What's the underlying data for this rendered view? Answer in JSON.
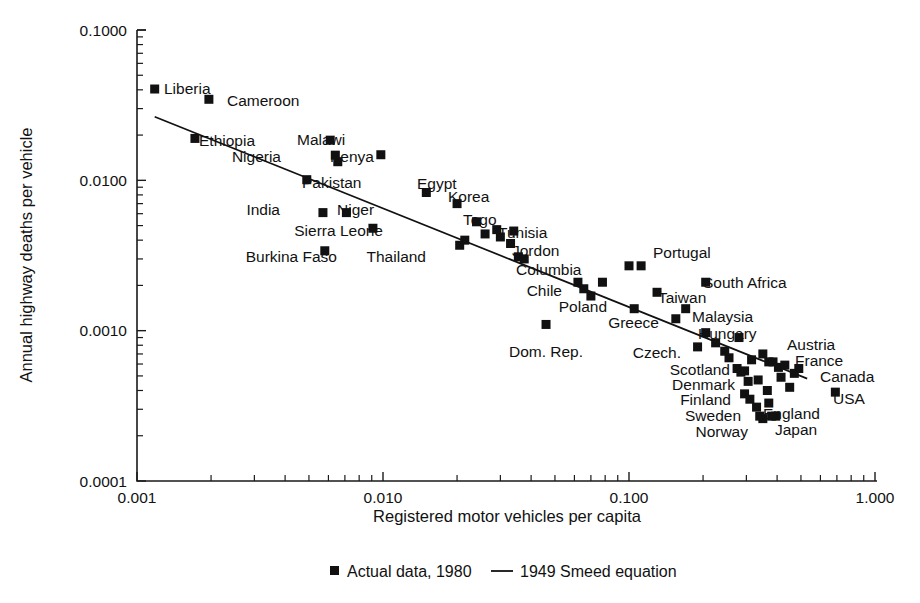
{
  "chart_data": {
    "type": "scatter",
    "title": "",
    "xlabel": "Registered motor vehicles per capita",
    "ylabel": "Annual highway deaths per vehicle",
    "xscale": "log",
    "yscale": "log",
    "xlim": [
      0.001,
      1.0
    ],
    "ylim": [
      0.0001,
      0.1
    ],
    "xticks": [
      "0.001",
      "0.010",
      "0.100",
      "1.000"
    ],
    "yticks": [
      "0.0001",
      "0.0010",
      "0.0100",
      "0.1000"
    ],
    "grid": false,
    "legend_position": "bottom-center",
    "legend": [
      {
        "marker": "square",
        "label": "Actual data, 1980"
      },
      {
        "marker": "line",
        "label": "1949 Smeed equation"
      }
    ],
    "series": [
      {
        "name": "Actual data, 1980",
        "marker": "square",
        "color": "#111111",
        "points": [
          {
            "label": "Liberia",
            "x": 0.00118,
            "y": 0.0405,
            "lx": 164,
            "ly": 94,
            "anchor": "start"
          },
          {
            "label": "Cameroon",
            "x": 0.00196,
            "y": 0.0346,
            "lx": 227,
            "ly": 106,
            "anchor": "start"
          },
          {
            "label": "Ethiopia",
            "x": 0.00172,
            "y": 0.019,
            "lx": 199,
            "ly": 146,
            "anchor": "start"
          },
          {
            "label": "Malawi",
            "x": 0.0061,
            "y": 0.0185,
            "lx": 297,
            "ly": 145,
            "anchor": "start"
          },
          {
            "label": "Nigeria",
            "x": 0.0064,
            "y": 0.0147,
            "lx": 281,
            "ly": 162,
            "anchor": "end"
          },
          {
            "label": "Kenya",
            "x": 0.0098,
            "y": 0.0148,
            "lx": 330,
            "ly": 162,
            "anchor": "start"
          },
          {
            "label": "Pakistan",
            "x": 0.0049,
            "y": 0.0101,
            "lx": 302,
            "ly": 188,
            "anchor": "start"
          },
          {
            "label": "Egypt",
            "x": 0.015,
            "y": 0.0083,
            "lx": 417,
            "ly": 189,
            "anchor": "start"
          },
          {
            "label": "Korea",
            "x": 0.02,
            "y": 0.007,
            "lx": 448,
            "ly": 202,
            "anchor": "start"
          },
          {
            "label": "India",
            "x": 0.0057,
            "y": 0.0061,
            "lx": 280,
            "ly": 215,
            "anchor": "end"
          },
          {
            "label": "Niger",
            "x": 0.0071,
            "y": 0.0061,
            "lx": 337,
            "ly": 215,
            "anchor": "start"
          },
          {
            "label": "Togo",
            "x": 0.024,
            "y": 0.0053,
            "lx": 463,
            "ly": 225,
            "anchor": "start"
          },
          {
            "label": "Sierra Leone",
            "x": 0.0091,
            "y": 0.0048,
            "lx": 383,
            "ly": 236,
            "anchor": "end"
          },
          {
            "label": "Tunisia",
            "x": 0.034,
            "y": 0.0046,
            "lx": 498,
            "ly": 238,
            "anchor": "start"
          },
          {
            "label": "Burkina Faso",
            "x": 0.0058,
            "y": 0.0034,
            "lx": 337,
            "ly": 262,
            "anchor": "end"
          },
          {
            "label": "Thailand",
            "x": 0.0205,
            "y": 0.0037,
            "lx": 426,
            "ly": 262,
            "anchor": "end"
          },
          {
            "label": "Jordon",
            "x": 0.033,
            "y": 0.0038,
            "lx": 512,
            "ly": 256,
            "anchor": "start"
          },
          {
            "label": "Columbia",
            "x": 0.0355,
            "y": 0.0031,
            "lx": 516,
            "ly": 275,
            "anchor": "start"
          },
          {
            "label": "Portugal",
            "x": 0.112,
            "y": 0.0027,
            "lx": 653,
            "ly": 258,
            "anchor": "start"
          },
          {
            "label": "Chile",
            "x": 0.062,
            "y": 0.0021,
            "lx": 562,
            "ly": 296,
            "anchor": "end"
          },
          {
            "label": "South Africa",
            "x": 0.205,
            "y": 0.0021,
            "lx": 703,
            "ly": 288,
            "anchor": "start"
          },
          {
            "label": "Taiwan",
            "x": 0.13,
            "y": 0.0018,
            "lx": 658,
            "ly": 303,
            "anchor": "start"
          },
          {
            "label": "Poland",
            "x": 0.07,
            "y": 0.0017,
            "lx": 607,
            "ly": 312,
            "anchor": "end"
          },
          {
            "label": "Greece",
            "x": 0.105,
            "y": 0.0014,
            "lx": 659,
            "ly": 328,
            "anchor": "end"
          },
          {
            "label": "Malaysia",
            "x": 0.17,
            "y": 0.0014,
            "lx": 692,
            "ly": 322,
            "anchor": "start"
          },
          {
            "label": "Hungary",
            "x": 0.155,
            "y": 0.0012,
            "lx": 698,
            "ly": 339,
            "anchor": "start"
          },
          {
            "label": "Dom. Rep.",
            "x": 0.046,
            "y": 0.0011,
            "lx": 546,
            "ly": 357,
            "anchor": "middle"
          },
          {
            "label": "Austria",
            "x": 0.28,
            "y": 0.0009,
            "lx": 787,
            "ly": 350,
            "anchor": "start"
          },
          {
            "label": "Czech.",
            "x": 0.19,
            "y": 0.00078,
            "lx": 681,
            "ly": 358,
            "anchor": "end"
          },
          {
            "label": "France",
            "x": 0.37,
            "y": 0.00062,
            "lx": 795,
            "ly": 366,
            "anchor": "start"
          },
          {
            "label": "Canada",
            "x": 0.49,
            "y": 0.00056,
            "lx": 820,
            "ly": 382,
            "anchor": "start"
          },
          {
            "label": "Scotland",
            "x": 0.285,
            "y": 0.00053,
            "lx": 730,
            "ly": 375,
            "anchor": "end"
          },
          {
            "label": "Denmark",
            "x": 0.305,
            "y": 0.00046,
            "lx": 735,
            "ly": 390,
            "anchor": "end"
          },
          {
            "label": "USA",
            "x": 0.69,
            "y": 0.00039,
            "lx": 833,
            "ly": 404,
            "anchor": "start"
          },
          {
            "label": "Finland",
            "x": 0.295,
            "y": 0.00038,
            "lx": 731,
            "ly": 405,
            "anchor": "end"
          },
          {
            "label": "England",
            "x": 0.37,
            "y": 0.00033,
            "lx": 763,
            "ly": 419,
            "anchor": "start"
          },
          {
            "label": "Sweden",
            "x": 0.33,
            "y": 0.00031,
            "lx": 741,
            "ly": 421,
            "anchor": "end"
          },
          {
            "label": "Japan",
            "x": 0.395,
            "y": 0.00027,
            "lx": 775,
            "ly": 435,
            "anchor": "start"
          },
          {
            "label": "Norway",
            "x": 0.35,
            "y": 0.00026,
            "lx": 748,
            "ly": 437,
            "anchor": "end"
          }
        ],
        "unlabeled_points": [
          {
            "x": 0.00655,
            "y": 0.0133
          },
          {
            "x": 0.0215,
            "y": 0.004
          },
          {
            "x": 0.026,
            "y": 0.0044
          },
          {
            "x": 0.029,
            "y": 0.0047
          },
          {
            "x": 0.03,
            "y": 0.0042
          },
          {
            "x": 0.0375,
            "y": 0.003
          },
          {
            "x": 0.0655,
            "y": 0.0019
          },
          {
            "x": 0.078,
            "y": 0.0021
          },
          {
            "x": 0.1,
            "y": 0.0027
          },
          {
            "x": 0.205,
            "y": 0.00097
          },
          {
            "x": 0.225,
            "y": 0.00083
          },
          {
            "x": 0.255,
            "y": 0.00066
          },
          {
            "x": 0.275,
            "y": 0.00056
          },
          {
            "x": 0.295,
            "y": 0.00054
          },
          {
            "x": 0.315,
            "y": 0.00064
          },
          {
            "x": 0.335,
            "y": 0.00047
          },
          {
            "x": 0.35,
            "y": 0.0007
          },
          {
            "x": 0.385,
            "y": 0.00062
          },
          {
            "x": 0.405,
            "y": 0.00057
          },
          {
            "x": 0.415,
            "y": 0.00049
          },
          {
            "x": 0.43,
            "y": 0.00059
          },
          {
            "x": 0.45,
            "y": 0.00042
          },
          {
            "x": 0.365,
            "y": 0.0004
          },
          {
            "x": 0.31,
            "y": 0.00035
          },
          {
            "x": 0.34,
            "y": 0.00027
          },
          {
            "x": 0.38,
            "y": 0.00027
          },
          {
            "x": 0.47,
            "y": 0.00052
          },
          {
            "x": 0.245,
            "y": 0.00073
          }
        ]
      },
      {
        "name": "1949 Smeed equation",
        "type": "line",
        "color": "#111111",
        "x_start": 0.00118,
        "y_start": 0.0265,
        "x_end": 0.53,
        "y_end": 0.00048
      }
    ]
  }
}
